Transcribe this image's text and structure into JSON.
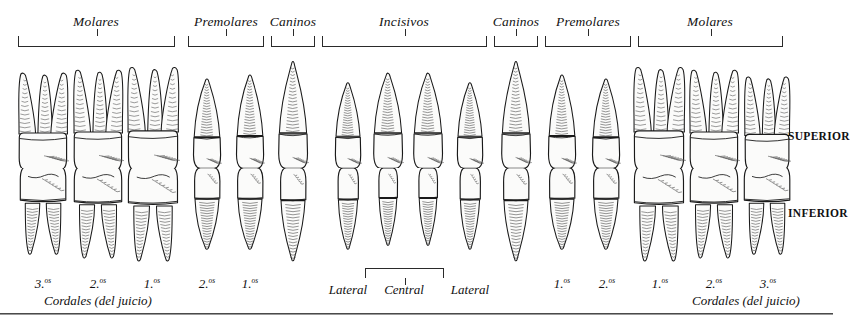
{
  "figure": {
    "rows": [
      {
        "id": "upper",
        "side_label": "SUPERIOR"
      },
      {
        "id": "lower",
        "side_label": "INFERIOR"
      }
    ]
  },
  "groups": [
    {
      "label": "Molares",
      "x": 96,
      "left": 18,
      "right": 175
    },
    {
      "label": "Premolares",
      "x": 226,
      "left": 188,
      "right": 264
    },
    {
      "label": "Caninos",
      "x": 293,
      "left": 271,
      "right": 315
    },
    {
      "label": "Incisivos",
      "x": 404,
      "left": 322,
      "right": 487
    },
    {
      "label": "Caninos",
      "x": 516,
      "left": 494,
      "right": 538
    },
    {
      "label": "Premolares",
      "x": 588,
      "left": 545,
      "right": 631
    },
    {
      "label": "Molares",
      "x": 710,
      "left": 638,
      "right": 783
    }
  ],
  "central_bracket": {
    "label": "Central",
    "x": 404,
    "left": 365,
    "right": 444
  },
  "tooth_numbers": [
    {
      "text": "3.",
      "sup": "os",
      "x": 43
    },
    {
      "text": "2.",
      "sup": "os",
      "x": 98
    },
    {
      "text": "1.",
      "sup": "os",
      "x": 152
    },
    {
      "text": "2.",
      "sup": "os",
      "x": 207
    },
    {
      "text": "1.",
      "sup": "os",
      "x": 250
    },
    {
      "text": "1.",
      "sup": "os",
      "x": 562
    },
    {
      "text": "2.",
      "sup": "os",
      "x": 607
    },
    {
      "text": "1.",
      "sup": "os",
      "x": 660
    },
    {
      "text": "2.",
      "sup": "os",
      "x": 714
    },
    {
      "text": "3.",
      "sup": "os",
      "x": 768
    }
  ],
  "position_labels": [
    {
      "text": "Lateral",
      "x": 348
    },
    {
      "text": "Central",
      "x": 404
    },
    {
      "text": "Lateral",
      "x": 470
    }
  ],
  "cordales_labels": [
    {
      "text": "Cordales (del juicio)",
      "x": 98
    },
    {
      "text": "Cordales (del juicio)",
      "x": 746
    }
  ],
  "upper_teeth": [
    {
      "name": "molar-3-upper-left",
      "x": 43,
      "type": "molar_upper",
      "w": 52,
      "h": 100
    },
    {
      "name": "molar-2-upper-left",
      "x": 98,
      "type": "molar_upper",
      "w": 52,
      "h": 103
    },
    {
      "name": "molar-1-upper-left",
      "x": 153,
      "type": "molar_upper",
      "w": 54,
      "h": 106
    },
    {
      "name": "premolar-2-upper-left",
      "x": 207,
      "type": "premolar_upper",
      "w": 32,
      "h": 92
    },
    {
      "name": "premolar-1-upper-left",
      "x": 250,
      "type": "premolar_upper",
      "w": 32,
      "h": 96
    },
    {
      "name": "canine-upper-left",
      "x": 293,
      "type": "canine_upper",
      "w": 34,
      "h": 110
    },
    {
      "name": "incisor-lateral-upper-left",
      "x": 348,
      "type": "incisor_upper",
      "w": 30,
      "h": 88
    },
    {
      "name": "incisor-central-upper-left",
      "x": 388,
      "type": "incisor_upper",
      "w": 34,
      "h": 98
    },
    {
      "name": "incisor-central-upper-right",
      "x": 428,
      "type": "incisor_upper",
      "w": 34,
      "h": 98
    },
    {
      "name": "incisor-lateral-upper-right",
      "x": 470,
      "type": "incisor_upper",
      "w": 30,
      "h": 88
    },
    {
      "name": "canine-upper-right",
      "x": 516,
      "type": "canine_upper",
      "w": 34,
      "h": 110
    },
    {
      "name": "premolar-1-upper-right",
      "x": 562,
      "type": "premolar_upper",
      "w": 32,
      "h": 96
    },
    {
      "name": "premolar-2-upper-right",
      "x": 606,
      "type": "premolar_upper",
      "w": 32,
      "h": 92
    },
    {
      "name": "molar-1-upper-right",
      "x": 659,
      "type": "molar_upper",
      "w": 54,
      "h": 106
    },
    {
      "name": "molar-2-upper-right",
      "x": 714,
      "type": "molar_upper",
      "w": 52,
      "h": 103
    },
    {
      "name": "molar-3-upper-right",
      "x": 767,
      "type": "molar_upper",
      "w": 48,
      "h": 96
    }
  ],
  "lower_teeth": [
    {
      "name": "molar-3-lower-left",
      "x": 43,
      "type": "molar_lower",
      "w": 50,
      "h": 88
    },
    {
      "name": "molar-2-lower-left",
      "x": 98,
      "type": "molar_lower",
      "w": 52,
      "h": 92
    },
    {
      "name": "molar-1-lower-left",
      "x": 153,
      "type": "molar_lower",
      "w": 54,
      "h": 95
    },
    {
      "name": "premolar-2-lower-left",
      "x": 207,
      "type": "premolar_lower",
      "w": 30,
      "h": 84
    },
    {
      "name": "premolar-1-lower-left",
      "x": 250,
      "type": "premolar_lower",
      "w": 30,
      "h": 84
    },
    {
      "name": "canine-lower-left",
      "x": 293,
      "type": "canine_lower",
      "w": 30,
      "h": 96
    },
    {
      "name": "incisor-lateral-lower-left",
      "x": 348,
      "type": "incisor_lower",
      "w": 24,
      "h": 84
    },
    {
      "name": "incisor-central-lower-left",
      "x": 388,
      "type": "incisor_lower",
      "w": 22,
      "h": 80
    },
    {
      "name": "incisor-central-lower-right",
      "x": 428,
      "type": "incisor_lower",
      "w": 22,
      "h": 80
    },
    {
      "name": "incisor-lateral-lower-right",
      "x": 470,
      "type": "incisor_lower",
      "w": 24,
      "h": 84
    },
    {
      "name": "canine-lower-right",
      "x": 516,
      "type": "canine_lower",
      "w": 30,
      "h": 96
    },
    {
      "name": "premolar-1-lower-right",
      "x": 562,
      "type": "premolar_lower",
      "w": 30,
      "h": 84
    },
    {
      "name": "premolar-2-lower-right",
      "x": 606,
      "type": "premolar_lower",
      "w": 30,
      "h": 84
    },
    {
      "name": "molar-1-lower-right",
      "x": 659,
      "type": "molar_lower",
      "w": 54,
      "h": 95
    },
    {
      "name": "molar-2-lower-right",
      "x": 714,
      "type": "molar_lower",
      "w": 52,
      "h": 92
    },
    {
      "name": "molar-3-lower-right",
      "x": 767,
      "type": "molar_lower",
      "w": 50,
      "h": 88
    }
  ],
  "colors": {
    "outline": "#1a1a1a",
    "shading": "#4a4a4a",
    "enamel": "#fbfbfa",
    "rule": "#4a4a4a"
  },
  "layout": {
    "upper_row_baseline": 168,
    "lower_row_top": 168,
    "bracket_y": 36,
    "group_label_y": 14,
    "footer_rule_y": 313,
    "side_label_upper_y": 130,
    "side_label_lower_y": 207,
    "side_label_x": 788,
    "num_label_y": 276,
    "pos_label_y": 282,
    "cordales_y": 293,
    "central_bracket_y": 268
  }
}
